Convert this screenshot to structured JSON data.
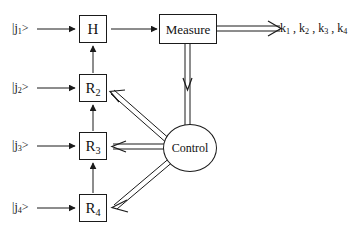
{
  "diagram": {
    "inputs": [
      {
        "id": "in1",
        "label": "|j₁>",
        "base": "|j",
        "sub": "1",
        "close": ">"
      },
      {
        "id": "in2",
        "label": "|j₂>",
        "base": "|j",
        "sub": "2",
        "close": ">"
      },
      {
        "id": "in3",
        "label": "|j₃>",
        "base": "|j",
        "sub": "3",
        "close": ">"
      },
      {
        "id": "in4",
        "label": "|j₄>",
        "base": "|j",
        "sub": "4",
        "close": ">"
      }
    ],
    "gates": [
      {
        "id": "h",
        "label": "H",
        "base": "H",
        "sub": ""
      },
      {
        "id": "r2",
        "label": "R2",
        "base": "R",
        "sub": "2"
      },
      {
        "id": "r3",
        "label": "R3",
        "base": "R",
        "sub": "3"
      },
      {
        "id": "r4",
        "label": "R4",
        "base": "R",
        "sub": "4"
      }
    ],
    "measure": {
      "label": "Measure"
    },
    "control": {
      "label": "Control"
    },
    "outputs": {
      "label": "k₁ , k₂ , k₃ , k₄",
      "items": [
        {
          "base": "k",
          "sub": "1"
        },
        {
          "base": "k",
          "sub": "2"
        },
        {
          "base": "k",
          "sub": "3"
        },
        {
          "base": "k",
          "sub": "4"
        }
      ],
      "separator": " , "
    },
    "colors": {
      "line": "#1a1a1a",
      "text": "#111111",
      "background": "#ffffff"
    }
  }
}
